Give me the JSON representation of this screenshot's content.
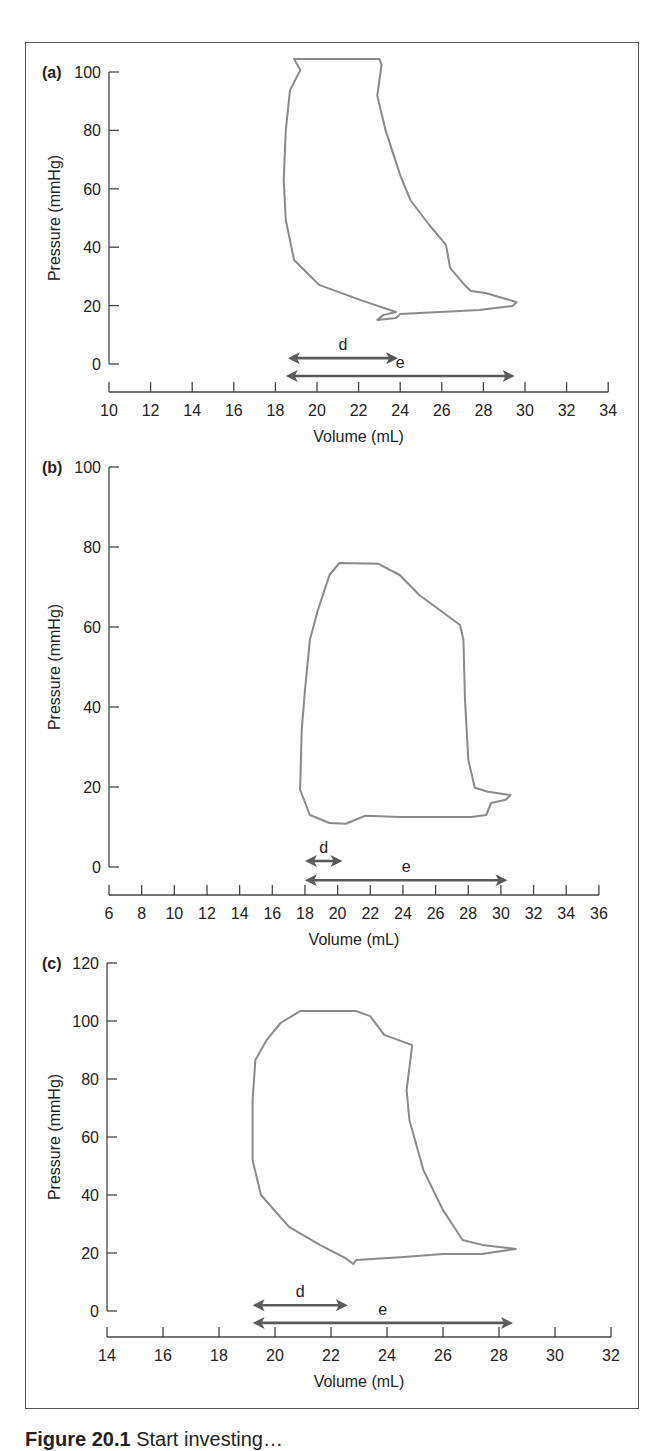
{
  "figure": {
    "caption_label": "Figure 20.1",
    "caption_text": "Start investing…",
    "colors": {
      "loop": "#8a8a8a",
      "arrow": "#5a5a5a",
      "axis": "#444444",
      "frame": "#555555"
    }
  },
  "chart_data": [
    {
      "type": "line",
      "panel": "(a)",
      "title": "",
      "xlabel": "Volume (mL)",
      "ylabel": "Pressure (mmHg)",
      "xlim": [
        10,
        34
      ],
      "ylim": [
        0,
        100
      ],
      "x_ticks": [
        10,
        12,
        14,
        16,
        18,
        20,
        22,
        24,
        26,
        28,
        30,
        32,
        34
      ],
      "y_ticks": [
        0,
        20,
        40,
        60,
        80,
        100
      ],
      "grid": false,
      "series": [
        {
          "name": "pressure-volume loop",
          "closed": true,
          "points": [
            [
              18.9,
              104.5
            ],
            [
              23.0,
              104.5
            ],
            [
              23.1,
              102.4
            ],
            [
              22.9,
              92
            ],
            [
              23.3,
              80
            ],
            [
              24.0,
              64.7
            ],
            [
              24.5,
              56
            ],
            [
              25.4,
              47.6
            ],
            [
              26.2,
              40.8
            ],
            [
              26.4,
              32.9
            ],
            [
              27.1,
              27
            ],
            [
              27.4,
              25
            ],
            [
              28.1,
              24.3
            ],
            [
              29.6,
              21.2
            ],
            [
              29.4,
              19.9
            ],
            [
              27.8,
              18.5
            ],
            [
              24.0,
              17.1
            ],
            [
              23.8,
              15.8
            ],
            [
              22.9,
              15.1
            ],
            [
              23.2,
              16.8
            ],
            [
              23.8,
              17.8
            ],
            [
              22.1,
              21.9
            ],
            [
              20.1,
              27.1
            ],
            [
              18.9,
              35.6
            ],
            [
              18.5,
              49.3
            ],
            [
              18.4,
              63
            ],
            [
              18.5,
              80
            ],
            [
              18.7,
              93.8
            ],
            [
              19.2,
              100.7
            ]
          ]
        }
      ],
      "annotations": [
        {
          "label": "d",
          "x_start": 18.6,
          "x_end": 23.9,
          "y": 2.0
        },
        {
          "label": "e",
          "x_start": 18.5,
          "x_end": 29.5,
          "y": -4.1
        }
      ],
      "layout": {
        "x0_px": 109,
        "px_per_x": 20.8,
        "y0_px": 364,
        "px_per_y": 2.92,
        "xaxis_px": 392,
        "ytop_value": 100
      }
    },
    {
      "type": "line",
      "panel": "(b)",
      "title": "",
      "xlabel": "Volume (mL)",
      "ylabel": "Pressure (mmHg)",
      "xlim": [
        6,
        36
      ],
      "ylim": [
        0,
        100
      ],
      "x_ticks": [
        6,
        8,
        10,
        12,
        14,
        16,
        18,
        20,
        22,
        24,
        26,
        28,
        30,
        32,
        34,
        36
      ],
      "y_ticks": [
        0,
        20,
        40,
        60,
        80,
        100
      ],
      "grid": false,
      "series": [
        {
          "name": "pressure-volume loop",
          "closed": true,
          "points": [
            [
              20.1,
              76
            ],
            [
              22.5,
              75.8
            ],
            [
              23.8,
              73
            ],
            [
              25.0,
              68
            ],
            [
              27.5,
              60.5
            ],
            [
              27.7,
              56.8
            ],
            [
              27.8,
              41.8
            ],
            [
              28.0,
              26.8
            ],
            [
              28.4,
              19.8
            ],
            [
              29.2,
              18.8
            ],
            [
              30.6,
              18
            ],
            [
              30.3,
              16.8
            ],
            [
              29.4,
              16
            ],
            [
              29.1,
              13
            ],
            [
              28.2,
              12.5
            ],
            [
              23.8,
              12.5
            ],
            [
              21.7,
              12.8
            ],
            [
              21.1,
              11.8
            ],
            [
              20.5,
              10.8
            ],
            [
              19.5,
              11
            ],
            [
              18.3,
              13
            ],
            [
              17.7,
              19.3
            ],
            [
              17.8,
              34.3
            ],
            [
              18.0,
              44.3
            ],
            [
              18.3,
              56.8
            ],
            [
              18.8,
              64.3
            ],
            [
              19.2,
              69.3
            ],
            [
              19.5,
              73
            ]
          ]
        }
      ],
      "annotations": [
        {
          "label": "d",
          "x_start": 18.0,
          "x_end": 20.3,
          "y": 1.5
        },
        {
          "label": "e",
          "x_start": 18.0,
          "x_end": 30.4,
          "y": -3.3
        }
      ],
      "layout": {
        "x0_px": 109,
        "px_per_x": 16.33,
        "y0_px": 867,
        "px_per_y": 4.0,
        "xaxis_px": 895,
        "ytop_value": 100
      }
    },
    {
      "type": "line",
      "panel": "(c)",
      "title": "",
      "xlabel": "Volume (mL)",
      "ylabel": "Pressure (mmHg)",
      "xlim": [
        14,
        32
      ],
      "ylim": [
        0,
        120
      ],
      "x_ticks": [
        14,
        16,
        18,
        20,
        22,
        24,
        26,
        28,
        30,
        32
      ],
      "y_ticks": [
        0,
        20,
        40,
        60,
        80,
        100,
        120
      ],
      "grid": false,
      "series": [
        {
          "name": "pressure-volume loop",
          "closed": true,
          "points": [
            [
              20.9,
              103.4
            ],
            [
              22.9,
              103.4
            ],
            [
              23.4,
              101.7
            ],
            [
              23.9,
              95.2
            ],
            [
              24.9,
              91.7
            ],
            [
              24.7,
              76.2
            ],
            [
              24.8,
              65.9
            ],
            [
              25.3,
              48.6
            ],
            [
              26.0,
              34.8
            ],
            [
              26.7,
              24.5
            ],
            [
              27.4,
              22.8
            ],
            [
              28.6,
              21.4
            ],
            [
              27.4,
              19.7
            ],
            [
              26.0,
              19.7
            ],
            [
              24.6,
              18.6
            ],
            [
              22.9,
              17.6
            ],
            [
              22.8,
              16.2
            ],
            [
              22.5,
              18.3
            ],
            [
              21.6,
              22.8
            ],
            [
              20.5,
              29
            ],
            [
              19.5,
              40
            ],
            [
              19.2,
              52
            ],
            [
              19.2,
              72.8
            ],
            [
              19.3,
              86.6
            ],
            [
              19.7,
              93.4
            ],
            [
              20.2,
              99.3
            ]
          ]
        }
      ],
      "annotations": [
        {
          "label": "d",
          "x_start": 19.2,
          "x_end": 22.6,
          "y": 2.0
        },
        {
          "label": "e",
          "x_start": 19.2,
          "x_end": 28.5,
          "y": -4.1
        }
      ],
      "layout": {
        "x0_px": 107,
        "px_per_x": 28.0,
        "y0_px": 1311,
        "px_per_y": 2.9,
        "xaxis_px": 1337,
        "ytop_value": 120
      }
    }
  ]
}
